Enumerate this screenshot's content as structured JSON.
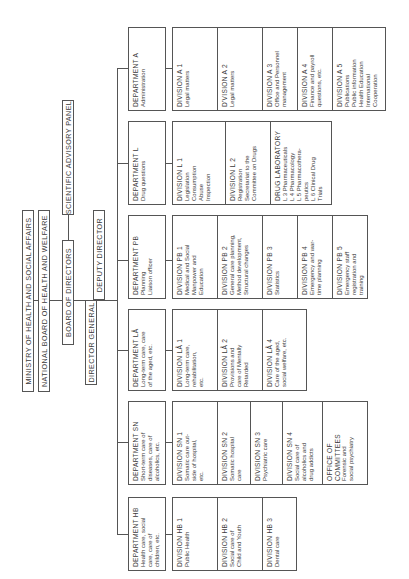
{
  "header": {
    "ministry": "MINISTRY OF HEALTH AND SOCIAL AFFAIRS",
    "national_board": "NATIONAL BOARD OF HEALTH AND WELFARE",
    "board_of_directors": "BOARD OF DIRECTORS",
    "scientific_panel": "SCIENTIFIC ADVISORY PANEL",
    "director_general": "DIRECTOR GENERAL",
    "deputy_director": "DEPUTY DIRECTOR"
  },
  "departments": [
    {
      "title": "DEPARTMENT HB",
      "desc": "Health care, social\ncare, care of\nchildren, etc.",
      "divisions": [
        {
          "title": "DIVISION HB 1",
          "desc": "Public Health"
        },
        {
          "title": "DIVISION HB 2",
          "desc": "Social care of\nChild and Youth"
        },
        {
          "title": "DIVISION HB 3",
          "desc": "Dental care"
        }
      ]
    },
    {
      "title": "DEPARTMENT SN",
      "desc": "Short-term care of\ndiseases, care of\nalcoholics, etc.",
      "divisions": [
        {
          "title": "DIVISION SN 1",
          "desc": "Somatic care out-\nside of hospital,\netc."
        },
        {
          "title": "DIVISION SN 2",
          "desc": "Somatic hospital\ncare"
        },
        {
          "title": "DIVISION SN 3",
          "desc": "Psychiatric care"
        },
        {
          "title": "DIVISION SN 4",
          "desc": "Social care of\nalcoholics and\ndrug addicts"
        },
        {
          "title": "OFFICE OF\nCOMMITTEES",
          "desc": "Forensic and\nsocial psychiatry"
        }
      ]
    },
    {
      "title": "DEPARTMENT LÅ",
      "desc": "Long-term care, care\nof the aged, etc.",
      "divisions": [
        {
          "title": "DIVISION LÅ 1",
          "desc": "Long-term care,\nrehabilitation,\netc."
        },
        {
          "title": "DIVISION LÅ 2",
          "desc": "Provisions and\ncare of Mentally\nRetarded"
        },
        {
          "title": "DIVISION LÅ 4",
          "desc": "Care of the aged,\nsocial welfare, etc."
        }
      ]
    },
    {
      "title": "DEPARTMENT PB",
      "desc": "Planning\n    Liaison officer",
      "divisions": [
        {
          "title": "DIVISION PB 1",
          "desc": "Medical and Social\nManpower and\nEducation"
        },
        {
          "title": "DIVISION PB 2",
          "desc": "General care planning,\nMethod development,\nStructural changes"
        },
        {
          "title": "DIVISION PB 3",
          "desc": "Statistics"
        },
        {
          "title": "DIVISION PB 4",
          "desc": "Emergency and war-\ntime planning"
        },
        {
          "title": "DIVISION PB 5",
          "desc": "Emergency staff\nregistration and\ntraining"
        }
      ]
    },
    {
      "title": "DEPARTMENT L",
      "desc": "Drug questions",
      "divisions": [
        {
          "title": "DIVISION L 1",
          "desc": "Legislation\nConsumption\nAbuse\nInspection"
        },
        {
          "title": "DIVISION L 2",
          "desc": "Registration\nSecretariat to the\nCommittee on Drugs"
        },
        {
          "title": "DRUG LABORATORY",
          "desc": "L 3 Pharmaceuticals\nL 4 Pharmacology\nL 5 Pharmacothera-\n      peutics\nL 6 Clinical Drug\n      Trials"
        }
      ]
    },
    {
      "title": "DEPARTMENT A",
      "desc": "Administration",
      "divisions": [
        {
          "title": "DIVISION A 1",
          "desc": "Legal matters"
        },
        {
          "title": "D'VISION A 2",
          "desc": "Legal matters"
        },
        {
          "title": "DIVISION A 3",
          "desc": "Office and Personnel\nmanagement"
        },
        {
          "title": "DIVISION A 4",
          "desc": "Finance and payroll\nquestions, etc."
        },
        {
          "title": "DIVISION A 5",
          "desc": "Publications\nPublic information\nHealth Education\nInternational\nCooperation"
        }
      ]
    }
  ]
}
